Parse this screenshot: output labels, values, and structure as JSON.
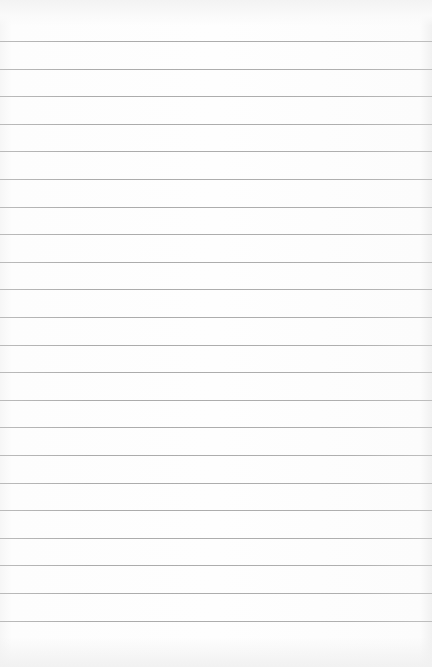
{
  "page": {
    "type": "lined-notepad-sheet",
    "background_color": "#fdfdfd",
    "rule_color": "#a4a4a4",
    "rule_count": 22,
    "first_rule_y": 41,
    "rule_spacing": 27.6,
    "text_lines": []
  }
}
